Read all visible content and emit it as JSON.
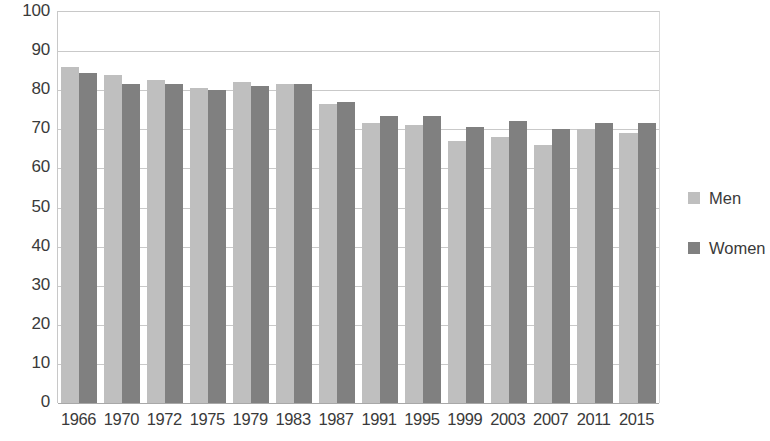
{
  "chart_data": {
    "type": "bar",
    "title": "",
    "xlabel": "",
    "ylabel": "",
    "ylim": [
      0,
      100
    ],
    "ytick_step": 10,
    "grid": true,
    "legend_position": "right",
    "categories": [
      "1966",
      "1970",
      "1972",
      "1975",
      "1979",
      "1983",
      "1987",
      "1991",
      "1995",
      "1999",
      "2003",
      "2007",
      "2011",
      "2015"
    ],
    "ytick_labels": [
      "100",
      "90",
      "80",
      "70",
      "60",
      "50",
      "40",
      "30",
      "20",
      "10",
      "0"
    ],
    "series": [
      {
        "name": "Men",
        "color": "#bfbfbf",
        "values": [
          86,
          84,
          82.5,
          80.5,
          82,
          81.5,
          76.5,
          71.5,
          71,
          67,
          68,
          66,
          70,
          69
        ]
      },
      {
        "name": "Women",
        "color": "#808080",
        "values": [
          84.5,
          81.5,
          81.5,
          80,
          81,
          81.5,
          77,
          73.5,
          73.5,
          70.5,
          72,
          70,
          71.5,
          71.5
        ]
      }
    ]
  },
  "legend": {
    "items": [
      {
        "label": "Men",
        "swatch": "men"
      },
      {
        "label": "Women",
        "swatch": "women"
      }
    ]
  }
}
